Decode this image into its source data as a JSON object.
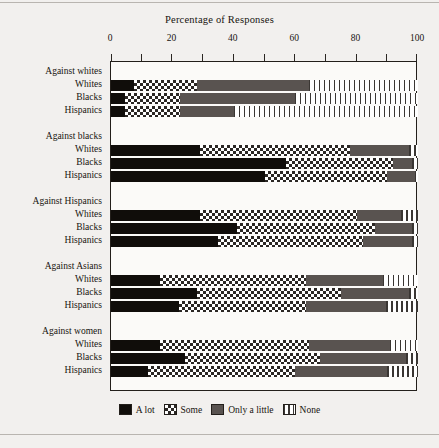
{
  "chart_data": {
    "type": "bar",
    "orientation": "horizontal",
    "stacked": true,
    "normalized_percent": true,
    "title": "Percentage of Responses",
    "xlabel": "",
    "ylabel": "",
    "xlim": [
      0,
      100
    ],
    "xticks": [
      0,
      10,
      20,
      30,
      40,
      50,
      60,
      70,
      80,
      90,
      100
    ],
    "xtick_labels": [
      "0",
      "20",
      "40",
      "60",
      "80",
      "100"
    ],
    "xtick_label_values": [
      0,
      20,
      40,
      60,
      80,
      100
    ],
    "grid": false,
    "legend_position": "bottom",
    "legend": [
      {
        "label": "A lot",
        "pattern": "solid-black",
        "color": "#100d0a"
      },
      {
        "label": "Some",
        "pattern": "checkerboard",
        "color": "#2b2724"
      },
      {
        "label": "Only a little",
        "pattern": "solid-gray",
        "color": "#595350"
      },
      {
        "label": "None",
        "pattern": "vertical-stripes",
        "color": "#3a3633"
      }
    ],
    "series": [
      {
        "name": "A lot",
        "values": [
          7.5,
          4.5,
          4.5,
          29,
          57,
          50,
          29,
          41,
          35,
          16,
          28,
          22,
          16,
          24,
          12
        ]
      },
      {
        "name": "Some",
        "values": [
          20.5,
          18,
          18,
          49,
          35,
          40,
          51,
          45,
          47,
          47.5,
          47,
          41.5,
          48.5,
          44,
          48
        ]
      },
      {
        "name": "Only a little",
        "values": [
          36.5,
          37.5,
          17.5,
          19,
          6,
          9,
          14.5,
          12,
          16,
          25,
          22,
          26,
          26.5,
          28,
          30
        ]
      },
      {
        "name": "None",
        "values": [
          35.5,
          40,
          60,
          3,
          2,
          1,
          5.5,
          2,
          2,
          11.5,
          3,
          10.5,
          9,
          4,
          10
        ]
      }
    ],
    "groups": [
      {
        "group_label": "Against whites",
        "rows": [
          {
            "label": "Whites",
            "segments": {
              "A lot": 7.5,
              "Some": 20.5,
              "Only a little": 36.5,
              "None": 35.5
            }
          },
          {
            "label": "Blacks",
            "segments": {
              "A lot": 4.5,
              "Some": 18.0,
              "Only a little": 37.5,
              "None": 40.0
            }
          },
          {
            "label": "Hispanics",
            "segments": {
              "A lot": 4.5,
              "Some": 18.0,
              "Only a little": 17.5,
              "None": 60.0
            }
          }
        ]
      },
      {
        "group_label": "Against blacks",
        "rows": [
          {
            "label": "Whites",
            "segments": {
              "A lot": 29.0,
              "Some": 49.0,
              "Only a little": 19.0,
              "None": 3.0
            }
          },
          {
            "label": "Blacks",
            "segments": {
              "A lot": 57.0,
              "Some": 35.0,
              "Only a little": 6.0,
              "None": 2.0
            }
          },
          {
            "label": "Hispanics",
            "segments": {
              "A lot": 50.0,
              "Some": 40.0,
              "Only a little": 9.0,
              "None": 1.0
            }
          }
        ]
      },
      {
        "group_label": "Against Hispanics",
        "rows": [
          {
            "label": "Whites",
            "segments": {
              "A lot": 29.0,
              "Some": 51.0,
              "Only a little": 14.5,
              "None": 5.5
            }
          },
          {
            "label": "Blacks",
            "segments": {
              "A lot": 41.0,
              "Some": 45.0,
              "Only a little": 12.0,
              "None": 2.0
            }
          },
          {
            "label": "Hispanics",
            "segments": {
              "A lot": 35.0,
              "Some": 47.0,
              "Only a little": 16.0,
              "None": 2.0
            }
          }
        ]
      },
      {
        "group_label": "Against Asians",
        "rows": [
          {
            "label": "Whites",
            "segments": {
              "A lot": 16.0,
              "Some": 47.5,
              "Only a little": 25.0,
              "None": 11.5
            }
          },
          {
            "label": "Blacks",
            "segments": {
              "A lot": 28.0,
              "Some": 47.0,
              "Only a little": 22.0,
              "None": 3.0
            }
          },
          {
            "label": "Hispanics",
            "segments": {
              "A lot": 22.0,
              "Some": 41.5,
              "Only a little": 26.0,
              "None": 10.5
            }
          }
        ]
      },
      {
        "group_label": "Against women",
        "rows": [
          {
            "label": "Whites",
            "segments": {
              "A lot": 16.0,
              "Some": 48.5,
              "Only a little": 26.5,
              "None": 9.0
            }
          },
          {
            "label": "Blacks",
            "segments": {
              "A lot": 24.0,
              "Some": 44.0,
              "Only a little": 28.0,
              "None": 4.0
            }
          },
          {
            "label": "Hispanics",
            "segments": {
              "A lot": 12.0,
              "Some": 48.0,
              "Only a little": 30.0,
              "None": 10.0
            }
          }
        ]
      }
    ]
  }
}
